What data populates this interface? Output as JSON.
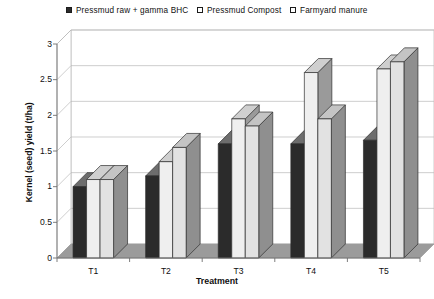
{
  "chart_data": {
    "type": "bar",
    "title": "",
    "xlabel": "Treatment",
    "ylabel": "Kernel (seed) yield (t/ha)",
    "categories": [
      "T1",
      "T2",
      "T3",
      "T4",
      "T5"
    ],
    "ylim": [
      0,
      3
    ],
    "yticks": [
      "0",
      "0.5",
      "1",
      "1.5",
      "2",
      "2.5",
      "3"
    ],
    "ytick_values": [
      0,
      0.5,
      1,
      1.5,
      2,
      2.5,
      3
    ],
    "grid": true,
    "legend_position": "top",
    "style": "3d-column",
    "series": [
      {
        "name": "Pressmud raw + gamma BHC",
        "color": "#2b2b2b",
        "side_color": "#5d5d5d",
        "top_color": "#6d6d6d",
        "values": [
          1.0,
          1.15,
          1.6,
          1.6,
          1.65
        ]
      },
      {
        "name": "Pressmud Compost",
        "color": "#efefef",
        "side_color": "#9a9a9a",
        "top_color": "#cfcfcf",
        "values": [
          1.1,
          1.35,
          1.95,
          2.6,
          2.65
        ]
      },
      {
        "name": "Farmyard manure",
        "color": "#e2e2e2",
        "side_color": "#8f8f8f",
        "top_color": "#c4c4c4",
        "values": [
          1.1,
          1.55,
          1.85,
          1.95,
          2.75
        ]
      }
    ]
  },
  "colors": {
    "axis": "#6f6f6f",
    "grid": "#b9b9b9",
    "floor": "#9b9b9b",
    "back_wall": "#ffffff",
    "text": "#0f0f0f"
  }
}
